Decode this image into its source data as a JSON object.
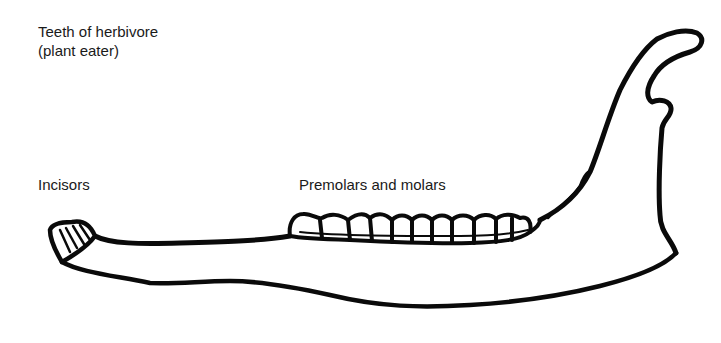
{
  "diagram": {
    "title_line1": "Teeth of herbivore",
    "title_line2": "(plant eater)",
    "labels": {
      "incisors": "Incisors",
      "premolars_molars": "Premolars and molars"
    },
    "colors": {
      "stroke": "#0a0a0a",
      "background": "#ffffff",
      "text": "#1a1a1a"
    }
  }
}
